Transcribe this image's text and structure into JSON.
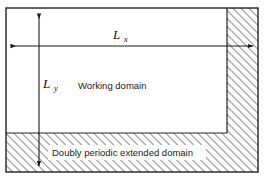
{
  "figure": {
    "title_alt": "Doubly periodic extended domain schematic",
    "width": 268,
    "height": 182,
    "background_color": "#ffffff"
  },
  "labels": {
    "lx": "L",
    "lx_sub": "x",
    "ly": "L",
    "ly_sub": "y",
    "working_domain": "Working domain",
    "extended_domain": "Doubly periodic extended domain"
  },
  "regions": {
    "working_domain": {
      "name": "Working domain",
      "fill": "#ffffff",
      "x": 6,
      "y": 8,
      "width": 221,
      "height": 125
    },
    "extended_domain": {
      "name": "Doubly periodic extended domain",
      "fill": "hatched",
      "hatch_color": "#3c3c3c",
      "hatch_angle_deg": 45,
      "hatch_spacing_px": 4
    }
  },
  "geometry": {
    "outer_rect": {
      "x": 6,
      "y": 8,
      "width": 252,
      "height": 164
    },
    "right_strip": {
      "x": 227,
      "y": 8,
      "width": 31,
      "height": 164
    },
    "bottom_band": {
      "x": 6,
      "y": 133,
      "width": 252,
      "height": 39
    }
  },
  "arrows": {
    "lx_arrow": {
      "name": "horizontal double arrow Lx",
      "x1": 8,
      "y1": 46,
      "x2": 256,
      "y2": 46,
      "double_headed": true
    },
    "ly_arrow": {
      "name": "vertical double arrow Ly",
      "x1": 39,
      "y1": 10,
      "x2": 39,
      "y2": 170,
      "double_headed": true
    }
  },
  "colors": {
    "stroke": "#222222",
    "hatch": "#3c3c3c",
    "text": "#1a1a1a",
    "background": "#ffffff"
  }
}
